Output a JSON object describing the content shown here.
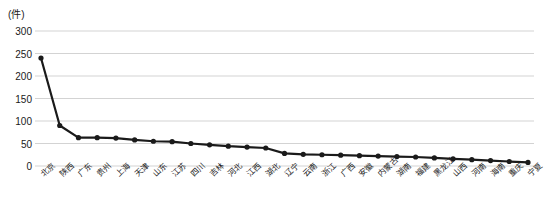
{
  "chart_data": {
    "type": "line",
    "title": "",
    "subtitle": "",
    "xlabel": "",
    "ylabel": "(件)",
    "unit_label": "(件)",
    "ylim": [
      0,
      300
    ],
    "yticks": [
      0,
      50,
      100,
      150,
      200,
      250,
      300
    ],
    "ytick_labels": [
      "0",
      "50",
      "100",
      "150",
      "200",
      "250",
      "300"
    ],
    "grid": true,
    "grid_axis": "y",
    "legend": false,
    "legend_position": "none",
    "marker": "circle",
    "line_color": "#1a1a1a",
    "marker_color": "#1a1a1a",
    "grid_color": "#c8c8c8",
    "categories": [
      "北京",
      "陕西",
      "广东",
      "贵州",
      "上海",
      "天津",
      "山东",
      "江苏",
      "四川",
      "吉林",
      "河北",
      "江西",
      "湖北",
      "辽宁",
      "云南",
      "浙江",
      "广西",
      "安徽",
      "内蒙古",
      "湖南",
      "福建",
      "黑龙江",
      "山西",
      "河南",
      "海南",
      "重庆",
      "宁夏"
    ],
    "values": [
      240,
      90,
      63,
      63,
      62,
      58,
      55,
      54,
      50,
      47,
      44,
      42,
      40,
      28,
      26,
      25,
      24,
      23,
      22,
      21,
      20,
      18,
      16,
      14,
      12,
      10,
      8
    ],
    "series": [
      {
        "name": "件数",
        "values": [
          240,
          90,
          63,
          63,
          62,
          58,
          55,
          54,
          50,
          47,
          44,
          42,
          40,
          28,
          26,
          25,
          24,
          23,
          22,
          21,
          20,
          18,
          16,
          14,
          12,
          10,
          8
        ]
      }
    ]
  }
}
